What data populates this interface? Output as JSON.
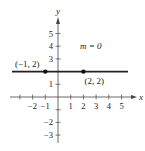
{
  "chart_data": {
    "type": "line",
    "title": "",
    "xlabel": "x",
    "ylabel": "y",
    "xlim": [
      -3,
      5.5
    ],
    "ylim": [
      -3.5,
      5.5
    ],
    "x_ticks": [
      -2,
      -1,
      1,
      2,
      3,
      4,
      5
    ],
    "y_ticks": [
      -3,
      -2,
      -1,
      1,
      2,
      3,
      4,
      5
    ],
    "x_tick_labels": [
      "−2",
      "−1",
      "1",
      "2",
      "3",
      "4",
      "5"
    ],
    "y_tick_labels": [
      "−3",
      "−2",
      "1",
      "3",
      "4",
      "5"
    ],
    "series": [
      {
        "name": "horizontal line",
        "x": [
          -3,
          5.5
        ],
        "y": [
          2,
          2
        ]
      }
    ],
    "points": [
      {
        "x": -1,
        "y": 2,
        "label": "(−1, 2)"
      },
      {
        "x": 2,
        "y": 2,
        "label": "(2, 2)"
      }
    ],
    "annotations": [
      {
        "text": "m = 0",
        "x": 2.6,
        "y": 4
      }
    ],
    "grid": false
  }
}
